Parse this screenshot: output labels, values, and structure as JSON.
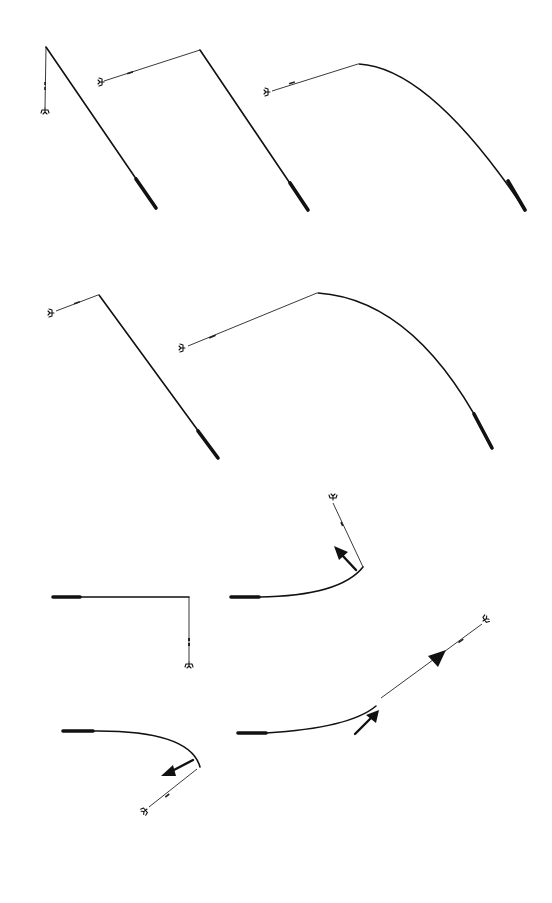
{
  "diagram": {
    "type": "fly-casting rod and line positions",
    "background": "#ffffff",
    "ink_color": "#111111",
    "figure_count": 9,
    "figures": [
      {
        "id": "fig-1",
        "description": "rod angled down-right, line hanging straight down from tip to fly"
      },
      {
        "id": "fig-2",
        "description": "straight rod angled down-right, line extending left to fly"
      },
      {
        "id": "fig-3",
        "description": "curved (loaded) rod, line extending left to fly"
      },
      {
        "id": "fig-4",
        "description": "straight rod angled down-right, short line extending left to fly"
      },
      {
        "id": "fig-5",
        "description": "strongly curved rod, line extending down-left to fly"
      },
      {
        "id": "fig-6",
        "description": "horizontal rod, line hanging straight down from tip"
      },
      {
        "id": "fig-7",
        "description": "rod curving upward, line up-left, arrow pointing up-left"
      },
      {
        "id": "fig-8",
        "description": "rod curving downward, line down-left, arrow pointing down-left"
      },
      {
        "id": "fig-9",
        "description": "rod curving up-right, line continues up-right with direction triangle, arrow pointing up-right"
      }
    ],
    "icons": {
      "fly": "fly-icon",
      "arrow": "motion-arrow-icon",
      "direction_marker": "triangle-direction-icon"
    }
  }
}
